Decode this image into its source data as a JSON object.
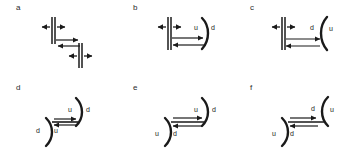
{
  "figure": {
    "type": "scientific-line-diagram",
    "background_color": "#ffffff",
    "line_color": "#1a1a1a",
    "label_color": "#2b2b2b",
    "panel_grid": {
      "rows": 2,
      "columns": 3
    }
  },
  "panels": [
    {
      "id": "a",
      "label": "a",
      "row": 0,
      "column": 0,
      "fault_style": "straight-double-line",
      "fault_count": 2,
      "arrangement": "offset-diagonal-right-down",
      "throw_labels": [],
      "extension_arrows": [
        {
          "on": "upper-fault",
          "directions": [
            "left",
            "right"
          ]
        },
        {
          "on": "lower-fault",
          "directions": [
            "left",
            "right"
          ]
        }
      ],
      "shear_arrows": [
        {
          "position": "upper",
          "direction": "right"
        },
        {
          "position": "lower",
          "direction": "left"
        }
      ]
    },
    {
      "id": "b",
      "label": "b",
      "row": 0,
      "column": 1,
      "fault_style": "straight-double-line-plus-arc",
      "fault_count": 2,
      "arrangement": "straight-left-arc-right",
      "throw_labels": [
        {
          "text": "u",
          "side": "inner-right"
        },
        {
          "text": "d",
          "side": "outer-right"
        }
      ],
      "extension_arrows": [
        {
          "on": "left-fault",
          "directions": [
            "left",
            "right"
          ]
        }
      ],
      "shear_arrows": [
        {
          "position": "upper",
          "direction": "right"
        },
        {
          "position": "lower",
          "direction": "left"
        }
      ]
    },
    {
      "id": "c",
      "label": "c",
      "row": 0,
      "column": 2,
      "fault_style": "straight-double-line-plus-arc",
      "fault_count": 2,
      "arrangement": "straight-left-reversed-arc-right",
      "throw_labels": [
        {
          "text": "d",
          "side": "inner-right"
        },
        {
          "text": "u",
          "side": "outer-right"
        }
      ],
      "extension_arrows": [
        {
          "on": "left-fault",
          "directions": [
            "left",
            "right"
          ]
        }
      ],
      "shear_arrows": [
        {
          "position": "upper",
          "direction": "right"
        },
        {
          "position": "lower",
          "direction": "left"
        }
      ]
    },
    {
      "id": "d",
      "label": "d",
      "row": 1,
      "column": 0,
      "fault_style": "double-arc",
      "fault_count": 2,
      "arrangement": "arcs-facing-same-way-offset",
      "throw_labels": [
        {
          "text": "u",
          "side": "upper-inner"
        },
        {
          "text": "d",
          "side": "upper-outer"
        },
        {
          "text": "d",
          "side": "lower-outer"
        },
        {
          "text": "u",
          "side": "lower-inner"
        }
      ],
      "extension_arrows": [],
      "shear_arrows": [
        {
          "position": "upper",
          "direction": "right"
        },
        {
          "position": "lower",
          "direction": "left"
        }
      ]
    },
    {
      "id": "e",
      "label": "e",
      "row": 1,
      "column": 1,
      "fault_style": "double-arc",
      "fault_count": 2,
      "arrangement": "arcs-mirrored-offset",
      "throw_labels": [
        {
          "text": "u",
          "side": "upper-inner"
        },
        {
          "text": "d",
          "side": "upper-outer"
        },
        {
          "text": "u",
          "side": "lower-outer"
        },
        {
          "text": "d",
          "side": "lower-inner"
        }
      ],
      "extension_arrows": [],
      "shear_arrows": [
        {
          "position": "upper",
          "direction": "right"
        },
        {
          "position": "lower",
          "direction": "left"
        }
      ]
    },
    {
      "id": "f",
      "label": "f",
      "row": 1,
      "column": 2,
      "fault_style": "double-arc",
      "fault_count": 2,
      "arrangement": "arcs-opposed-offset",
      "throw_labels": [
        {
          "text": "d",
          "side": "upper-inner"
        },
        {
          "text": "u",
          "side": "upper-outer"
        },
        {
          "text": "u",
          "side": "lower-outer"
        },
        {
          "text": "d",
          "side": "lower-inner"
        }
      ],
      "extension_arrows": [],
      "shear_arrows": [
        {
          "position": "upper",
          "direction": "right"
        },
        {
          "position": "lower",
          "direction": "left"
        }
      ]
    }
  ]
}
